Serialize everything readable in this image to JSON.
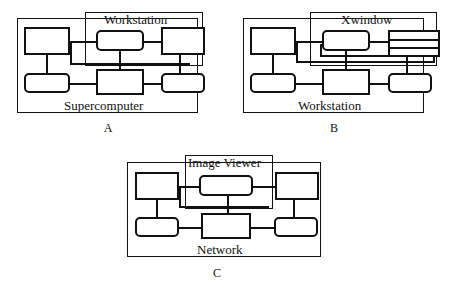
{
  "document": {
    "type": "figure",
    "description": "Three network topology diagrams labeled A, B and C"
  },
  "figures": [
    {
      "id": "A",
      "caption": "A",
      "inner_label": "Workstation",
      "outer_label": "Supercomputer",
      "nodes": [
        {
          "name": "node-a-top-left",
          "shape": "rect"
        },
        {
          "name": "node-a-top-center",
          "shape": "rounded"
        },
        {
          "name": "node-a-top-right",
          "shape": "rect"
        },
        {
          "name": "node-a-bottom-left",
          "shape": "rounded"
        },
        {
          "name": "node-a-bottom-center",
          "shape": "rect"
        },
        {
          "name": "node-a-bottom-right",
          "shape": "rounded"
        }
      ]
    },
    {
      "id": "B",
      "caption": "B",
      "inner_label": "Xwindow",
      "outer_label": "Workstation",
      "nodes": [
        {
          "name": "node-b-top-left",
          "shape": "rect"
        },
        {
          "name": "node-b-top-center",
          "shape": "rounded"
        },
        {
          "name": "node-b-top-right",
          "shape": "stacked"
        },
        {
          "name": "node-b-bottom-left",
          "shape": "rounded"
        },
        {
          "name": "node-b-bottom-center",
          "shape": "rect"
        },
        {
          "name": "node-b-bottom-right",
          "shape": "rounded"
        }
      ]
    },
    {
      "id": "C",
      "caption": "C",
      "inner_label": "Image Viewer",
      "outer_label": "Network",
      "nodes": [
        {
          "name": "node-c-top-left",
          "shape": "rect"
        },
        {
          "name": "node-c-top-center",
          "shape": "rounded"
        },
        {
          "name": "node-c-top-right",
          "shape": "rect"
        },
        {
          "name": "node-c-bottom-left",
          "shape": "rounded"
        },
        {
          "name": "node-c-bottom-center",
          "shape": "rect"
        },
        {
          "name": "node-c-bottom-right",
          "shape": "rounded"
        }
      ]
    }
  ],
  "colors": {
    "ink": "#111111",
    "paper": "#ffffff"
  }
}
